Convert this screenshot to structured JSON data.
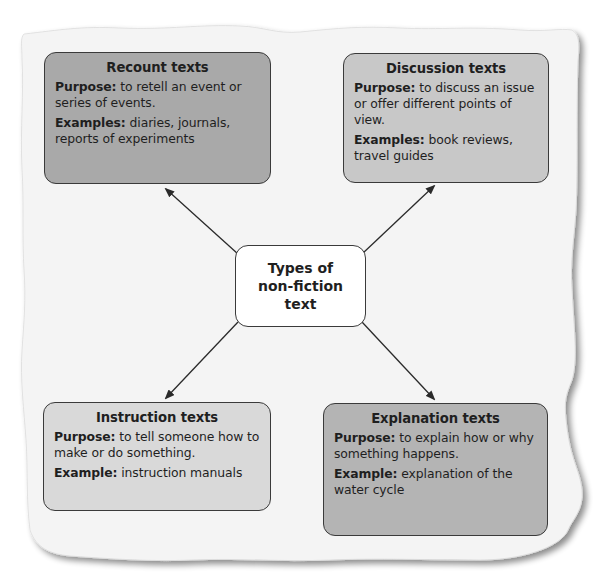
{
  "diagram": {
    "center": {
      "line1": "Types of",
      "line2": "non-fiction",
      "line3": "text"
    },
    "boxes": [
      {
        "id": "recount",
        "title": "Recount texts",
        "purpose_label": "Purpose:",
        "purpose_text": " to retell an event or series of events.",
        "examples_label": "Examples:",
        "examples_text": " diaries, journals, reports of experiments",
        "fill": "#a9a9a9"
      },
      {
        "id": "discussion",
        "title": "Discussion texts",
        "purpose_label": "Purpose:",
        "purpose_text": " to discuss an issue or offer different points of view.",
        "examples_label": "Examples:",
        "examples_text": " book reviews, travel guides",
        "fill": "#c8c8c8"
      },
      {
        "id": "instruction",
        "title": "Instruction texts",
        "purpose_label": "Purpose:",
        "purpose_text": " to tell someone how to make or do something.",
        "examples_label": "Example:",
        "examples_text": " instruction manuals",
        "fill": "#d9d9d9"
      },
      {
        "id": "explanation",
        "title": "Explanation texts",
        "purpose_label": "Purpose:",
        "purpose_text": " to explain how or why something happens.",
        "examples_label": "Example:",
        "examples_text": " explanation of the water cycle",
        "fill": "#b4b4b4"
      }
    ],
    "colors": {
      "paper": "#f4f4f4",
      "border": "#3a3a3a",
      "arrow": "#2a2a2a"
    }
  }
}
